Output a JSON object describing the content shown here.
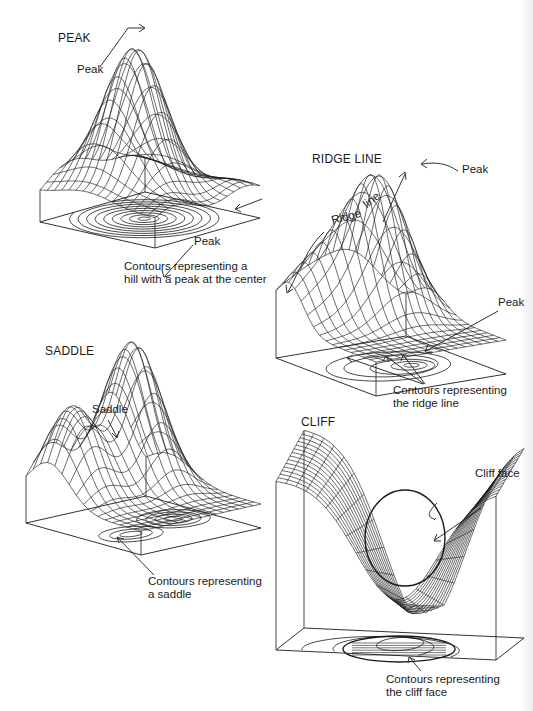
{
  "figure": {
    "panels": [
      {
        "id": "peak",
        "title": "PEAK",
        "labels": {
          "surface_peak": "Peak",
          "contour_peak": "Peak"
        },
        "caption": [
          "Contours representing a",
          "hill with a peak at the center"
        ]
      },
      {
        "id": "ridge",
        "title": "RIDGE LINE",
        "labels": {
          "surface_peak": "Peak",
          "ridge_word1": "Ridge",
          "ridge_word2": "line",
          "contour_peak": "Peak"
        },
        "caption": [
          "Contours representing",
          "the ridge line"
        ]
      },
      {
        "id": "saddle",
        "title": "SADDLE",
        "labels": {
          "saddle": "Saddle"
        },
        "caption": [
          "Contours representing",
          "a saddle"
        ]
      },
      {
        "id": "cliff",
        "title": "CLIFF",
        "labels": {
          "cliff_face": "Cliff face"
        },
        "caption": [
          "Contours representing",
          "the cliff face"
        ]
      }
    ],
    "colors": {
      "ink": "#1a1a1a",
      "background": "#ffffff"
    }
  }
}
